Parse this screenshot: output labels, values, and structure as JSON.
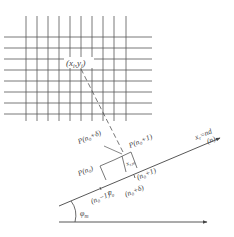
{
  "diagram": {
    "grid": {
      "vertical_lines_x": [
        26,
        37,
        48,
        59,
        70,
        81,
        92,
        103,
        114,
        126
      ],
      "vertical_span": [
        16,
        121
      ],
      "horizontal_lines_y": [
        37,
        48,
        59,
        70,
        81,
        92,
        103,
        114
      ],
      "horizontal_span": [
        4,
        152
      ]
    },
    "point_label": "(x",
    "point_label_i1": "i",
    "point_label_mid": ",y",
    "point_label_i2": "i",
    "point_label_end": ")",
    "axis_label": "x",
    "axis_label_sub": "r",
    "axis_label_eq": "=nd",
    "axis_label_n": "(n)",
    "angle_label": "φ",
    "angle_label_sub": "m",
    "labels": {
      "p_n0_delta": "P(n₀+δ)",
      "p_n0_plus1": "P(n₀+1)",
      "p_n0": "P(n₀)",
      "x_r_m": "x",
      "x_r_m_sub": "r,m",
      "n0": "n₀",
      "n0_minus1": "(n₀−1)",
      "n0_plus1": "(n₀+1)",
      "n0_plus_delta": "(n₀+δ)"
    },
    "colors": {
      "line": "#555555",
      "text": "#444444",
      "background": "#ffffff"
    }
  }
}
